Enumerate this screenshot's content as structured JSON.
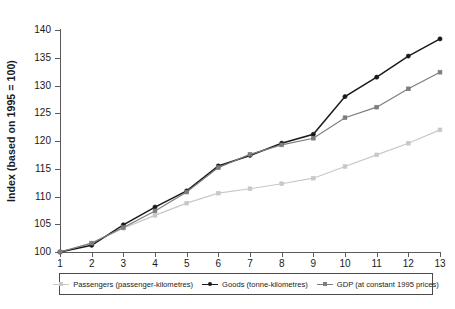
{
  "chart_data": {
    "type": "line",
    "title": "",
    "xlabel": "",
    "ylabel": "Index (based on 1995 = 100)",
    "xlim": [
      1,
      13
    ],
    "ylim": [
      100,
      140
    ],
    "grid": false,
    "legend_position": "bottom",
    "x": [
      1,
      2,
      3,
      4,
      5,
      6,
      7,
      8,
      9,
      10,
      11,
      12,
      13
    ],
    "xticklabels": [
      "1",
      "2",
      "3",
      "4",
      "5",
      "6",
      "7",
      "8",
      "9",
      "10",
      "11",
      "12",
      "13"
    ],
    "yticklabels": [
      "100",
      "105",
      "110",
      "115",
      "120",
      "125",
      "130",
      "135",
      "140"
    ],
    "yticks": [
      100,
      105,
      110,
      115,
      120,
      125,
      130,
      135,
      140
    ],
    "series": [
      {
        "name": "Passengers (passenger-kilometres)",
        "color": "#c8c8c8",
        "marker": "square",
        "values": [
          100.0,
          101.6,
          104.3,
          106.6,
          108.8,
          110.6,
          111.4,
          112.3,
          113.3,
          115.4,
          117.5,
          119.6,
          122.0
        ]
      },
      {
        "name": "Goods (tonne-kilometres)",
        "color": "#1a1a1a",
        "marker": "circle",
        "values": [
          100.0,
          101.2,
          104.9,
          108.1,
          111.0,
          115.5,
          117.4,
          119.6,
          121.2,
          128.0,
          131.5,
          135.3,
          138.4
        ]
      },
      {
        "name": "GDP (at constant 1995 prices)",
        "color": "#7d7d7d",
        "marker": "square",
        "values": [
          100.0,
          101.6,
          104.4,
          107.4,
          110.8,
          115.2,
          117.6,
          119.3,
          120.5,
          124.2,
          126.1,
          129.4,
          132.4
        ]
      }
    ]
  },
  "legend": {
    "items": [
      {
        "label": "Passengers (passenger-kilometres)",
        "color": "#c8c8c8"
      },
      {
        "label": "Goods (tonne-kilometres)",
        "color": "#1a1a1a"
      },
      {
        "label": "GDP (at constant 1995 prices)",
        "color": "#7d7d7d"
      }
    ]
  },
  "axis": {
    "y_title": "Index (based on 1995 = 100)"
  }
}
